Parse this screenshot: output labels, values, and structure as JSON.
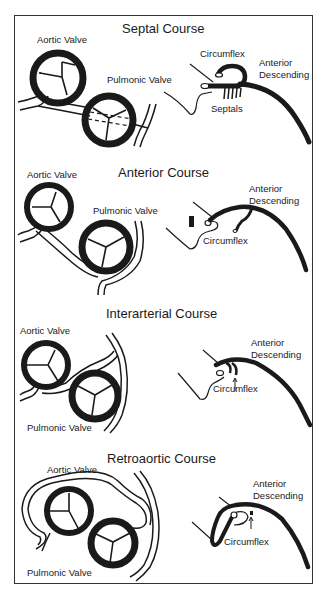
{
  "figure": {
    "panels": [
      {
        "title": "Septal Course",
        "labels": {
          "aortic": "Aortic Valve",
          "pulmonic": "Pulmonic Valve",
          "circumflex": "Circumflex",
          "lad_1": "Anterior",
          "lad_2": "Descending",
          "septals": "Septals"
        }
      },
      {
        "title": "Anterior Course",
        "labels": {
          "aortic": "Aortic Valve",
          "pulmonic": "Pulmonic Valve",
          "circumflex": "Circumflex",
          "lad_1": "Anterior",
          "lad_2": "Descending"
        }
      },
      {
        "title": "Interarterial Course",
        "labels": {
          "aortic": "Aortic Valve",
          "pulmonic": "Pulmonic Valve",
          "circumflex": "Circumflex",
          "lad_1": "Anterior",
          "lad_2": "Descending"
        }
      },
      {
        "title": "Retroaortic Course",
        "labels": {
          "aortic": "Aortic Valve",
          "pulmonic": "Pulmonic Valve",
          "circumflex": "Circumflex",
          "lad_1": "Anterior",
          "lad_2": "Descending"
        }
      }
    ],
    "colors": {
      "ink": "#1a1a1a",
      "background": "#ffffff",
      "frame": "#333333"
    }
  }
}
